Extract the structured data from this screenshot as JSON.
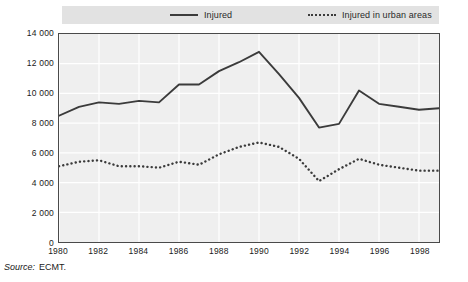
{
  "legend": {
    "items": [
      {
        "label": "Injured",
        "style": "solid",
        "color": "#3b3b3b"
      },
      {
        "label": "Injured in urban areas",
        "style": "dotted",
        "color": "#3b3b3b"
      }
    ]
  },
  "source": {
    "label": "Source:",
    "value": "ECMT."
  },
  "axes": {
    "y_ticks": [
      "14 000",
      "12 000",
      "10 000",
      "8 000",
      "6 000",
      "4 000",
      "2 000",
      "0"
    ],
    "x_ticks": [
      "1980",
      "1982",
      "1984",
      "1986",
      "1988",
      "1990",
      "1992",
      "1994",
      "1996",
      "1998"
    ]
  },
  "chart_data": {
    "type": "line",
    "title": "",
    "subtitle": "",
    "xlabel": "",
    "ylabel": "",
    "xlim": [
      1980,
      1999
    ],
    "ylim": [
      0,
      14000
    ],
    "ytick_step": 2000,
    "grid": true,
    "legend_position": "top",
    "x": [
      1980,
      1981,
      1982,
      1983,
      1984,
      1985,
      1986,
      1987,
      1988,
      1989,
      1990,
      1991,
      1992,
      1993,
      1994,
      1995,
      1996,
      1997,
      1998,
      1999
    ],
    "series": [
      {
        "name": "Injured",
        "style": "solid",
        "color": "#3b3b3b",
        "values": [
          8500,
          9100,
          9400,
          9300,
          9500,
          9400,
          10600,
          10600,
          11500,
          12100,
          12800,
          11300,
          9700,
          7700,
          7950,
          10200,
          9300,
          9100,
          8900,
          9000
        ]
      },
      {
        "name": "Injured in urban areas",
        "style": "dotted",
        "color": "#3b3b3b",
        "values": [
          5100,
          5400,
          5500,
          5100,
          5100,
          5000,
          5400,
          5200,
          5900,
          6400,
          6700,
          6400,
          5600,
          4100,
          4900,
          5600,
          5200,
          5000,
          4800,
          4800
        ]
      }
    ]
  }
}
